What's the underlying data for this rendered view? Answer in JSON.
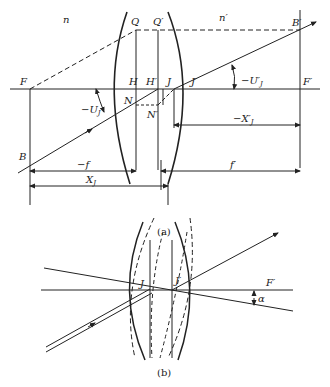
{
  "figure_a": {
    "caption": "(a)",
    "media_left": "n",
    "media_right": "n′",
    "points": {
      "F": "F",
      "Q": "Q",
      "Q_prime": "Q′",
      "B_prime": "B′",
      "H": "H",
      "H_prime": "H′",
      "J": "J",
      "J_prime": "J′",
      "F_prime": "F′",
      "N": "N",
      "N_prime": "N′",
      "B": "B"
    },
    "angles": {
      "U_J": "−U",
      "U_J_sub": "J",
      "U_J_prime": "−U′",
      "U_J_prime_sub": "J"
    },
    "dimensions": {
      "minus_f": "−f",
      "f_prime": "f′",
      "X_J": "X",
      "X_J_sub": "J",
      "minus_X_J_prime": "−X′",
      "minus_X_J_prime_sub": "J"
    }
  },
  "figure_b": {
    "caption": "(b)",
    "points": {
      "J": "J",
      "J_prime": "J′",
      "F_prime": "F′"
    },
    "angle": "α"
  },
  "colors": {
    "line": "#222222",
    "background": "#ffffff"
  }
}
